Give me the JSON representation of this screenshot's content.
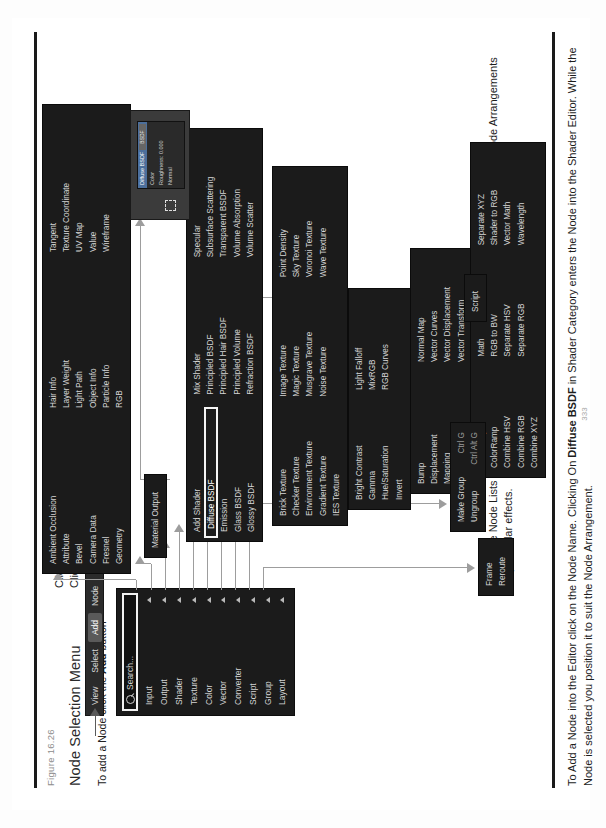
{
  "page": {
    "figure_number": "Figure 16.26",
    "title": "Node Selection Menu",
    "lead_bold": "To add a Node click the ",
    "lead_strong": "Add",
    "lead_tail": " button",
    "page_number": "333"
  },
  "paragraphs": {
    "top_line_1": "Clicking Add displays the Node Category Menu with the Search Panel at the top.",
    "top_line_2": "Clicking on a Category opens a Node List.",
    "middle": "Having the Node Lists displayed assists when following tutorials and seeking to replicate Node Arrangements for particular effects.",
    "bottom_1": "To Add a Node into the Editor click on the Node Name. Clicking On ",
    "bottom_bold_1": "Diffuse BSDF",
    "bottom_2": " in Shader Category enters the Node into the Shader Editor. While the Node is selected you position it to suit the Node Arrangement."
  },
  "menubar": {
    "items": [
      {
        "label": "View",
        "active": false
      },
      {
        "label": "Select",
        "active": false
      },
      {
        "label": "Add",
        "active": true
      },
      {
        "label": "Node",
        "active": false
      }
    ],
    "checkbox_label": "Use Nodes",
    "checkbox_checked": true
  },
  "category_menu": {
    "search_placeholder": "Search...",
    "items": [
      "Input",
      "Output",
      "Shader",
      "Texture",
      "Color",
      "Vector",
      "Converter",
      "Script",
      "Group",
      "Layout"
    ]
  },
  "lists": {
    "input": {
      "name": "Input",
      "items": [
        "Ambient Occlusion",
        "Attribute",
        "Bevel",
        "Camera Data",
        "Fresnel",
        "Geometry",
        "Hair Info",
        "Layer Weight",
        "Light Path",
        "Object Info",
        "Particle Info",
        "RGB",
        "Tangent",
        "Texture Coordinate",
        "UV Map",
        "Value",
        "Wireframe"
      ]
    },
    "output": {
      "name": "Output",
      "items": [
        "Material Output"
      ]
    },
    "shader": {
      "name": "Shader",
      "items": [
        "Add Shader",
        "Diffuse BSDF",
        "Emission",
        "Glass BSDF",
        "Glossy BSDF",
        "Mix Shader",
        "Principled BSDF",
        "Principled Hair BSDF",
        "Principled Volume",
        "Refraction BSDF",
        "Specular",
        "Subsurface Scattering",
        "Transparent BSDF",
        "Volume Absorption",
        "Volume Scatter"
      ],
      "selected": "Diffuse BSDF"
    },
    "texture": {
      "name": "Texture",
      "items": [
        "Brick Texture",
        "Checker Texture",
        "Environment Texture",
        "Gradient Texture",
        "IES Texture",
        "Image Texture",
        "Magic Texture",
        "Musgrave Texture",
        "Noise Texture",
        "Point Density",
        "Sky Texture",
        "Voronoi Texture",
        "Wave Texture"
      ]
    },
    "color": {
      "name": "Color",
      "items": [
        "Bright Contrast",
        "Gamma",
        "Hue/Saturation",
        "Invert",
        "Light Falloff",
        "MixRGB",
        "RGB Curves"
      ]
    },
    "vector": {
      "name": "Vector",
      "items": [
        "Bump",
        "Displacement",
        "Mapping",
        "Normal",
        "Normal Map",
        "Vector Curves",
        "Vector Displacement",
        "Vector Transform"
      ]
    },
    "converter": {
      "name": "Converter",
      "items": [
        "Blackbody",
        "ColorRamp",
        "Combine HSV",
        "Combine RGB",
        "Combine XYZ",
        "Math",
        "RGB to BW",
        "Separate HSV",
        "Separate RGB",
        "Separate XYZ",
        "Shader to RGB",
        "Vector Math",
        "Wavelength"
      ]
    },
    "layout": {
      "name": "Layout",
      "items": [
        "Frame",
        "Reroute"
      ]
    },
    "group": {
      "name": "Group",
      "items": [
        {
          "label": "Make Group",
          "shortcut": "Ctrl G"
        },
        {
          "label": "Ungroup",
          "shortcut": "Ctrl Alt G"
        }
      ]
    },
    "script": {
      "name": "Script",
      "items": [
        "Script"
      ]
    }
  },
  "thumbnail": {
    "node_header": "Diffuse BSDF",
    "badge": "BSDF",
    "rows": [
      "Color",
      "Roughness: 0.000",
      "Normal"
    ]
  },
  "colors": {
    "panel_bg": "#1b1b1b",
    "menubar_bg": "#2b2b2b",
    "text": "#d6d6d6",
    "highlight": "#5a5a5a",
    "checkbox": "#4772b3",
    "connector": "#9d9d9d",
    "node_header": "#4c6f9c"
  }
}
